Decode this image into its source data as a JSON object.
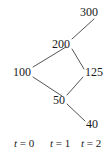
{
  "figure": {
    "type": "binomial-lattice-diagram",
    "background_color": "#ffffff",
    "line_color": "#555555",
    "text_color": "#1a1a1a"
  },
  "nodes": [
    {
      "id": "n100",
      "label": "100",
      "t": 0,
      "x": 31,
      "y": 72,
      "anchor": "right"
    },
    {
      "id": "n200",
      "label": "200",
      "t": 1,
      "x": 70,
      "y": 44,
      "anchor": "right"
    },
    {
      "id": "n50",
      "label": "50",
      "t": 1,
      "x": 65,
      "y": 100,
      "anchor": "right"
    },
    {
      "id": "n300",
      "label": "300",
      "t": 2,
      "x": 80,
      "y": 12,
      "anchor": "left"
    },
    {
      "id": "n125",
      "label": "125",
      "t": 2,
      "x": 85,
      "y": 72,
      "anchor": "left"
    },
    {
      "id": "n40",
      "label": "40",
      "t": 2,
      "x": 86,
      "y": 124,
      "anchor": "left"
    }
  ],
  "edges": [
    {
      "from": "n100",
      "to": "n200",
      "x1": 33,
      "y1": 67,
      "x2": 66,
      "y2": 47
    },
    {
      "from": "n100",
      "to": "n50",
      "x1": 33,
      "y1": 77,
      "x2": 62,
      "y2": 96
    },
    {
      "from": "n200",
      "to": "n300",
      "x1": 72,
      "y1": 39,
      "x2": 94,
      "y2": 19
    },
    {
      "from": "n200",
      "to": "n125",
      "x1": 72,
      "y1": 49,
      "x2": 84,
      "y2": 69
    },
    {
      "from": "n50",
      "to": "n125",
      "x1": 67,
      "y1": 95,
      "x2": 83,
      "y2": 77
    },
    {
      "from": "n50",
      "to": "n40",
      "x1": 67,
      "y1": 104,
      "x2": 85,
      "y2": 121
    }
  ],
  "time_axis": {
    "labels": [
      {
        "id": "t0",
        "var": "t",
        "eq": " = 0",
        "x": 14,
        "y": 138
      },
      {
        "id": "t1",
        "var": "t",
        "eq": " = 1",
        "x": 50,
        "y": 138
      },
      {
        "id": "t2",
        "var": "t",
        "eq": " = 2",
        "x": 81,
        "y": 138
      }
    ]
  },
  "chart_data": {
    "type": "diagram",
    "title": "",
    "periods": [
      0,
      1,
      2
    ],
    "values_by_period": {
      "0": [
        100
      ],
      "1": [
        200,
        50
      ],
      "2": [
        300,
        125,
        40
      ]
    },
    "transitions": [
      {
        "from": 100,
        "to": 200,
        "period": "0->1",
        "direction": "up"
      },
      {
        "from": 100,
        "to": 50,
        "period": "0->1",
        "direction": "down"
      },
      {
        "from": 200,
        "to": 300,
        "period": "1->2",
        "direction": "up"
      },
      {
        "from": 200,
        "to": 125,
        "period": "1->2",
        "direction": "down"
      },
      {
        "from": 50,
        "to": 125,
        "period": "1->2",
        "direction": "up"
      },
      {
        "from": 50,
        "to": 40,
        "period": "1->2",
        "direction": "down"
      }
    ],
    "xlabel": "t",
    "ylabel": ""
  }
}
